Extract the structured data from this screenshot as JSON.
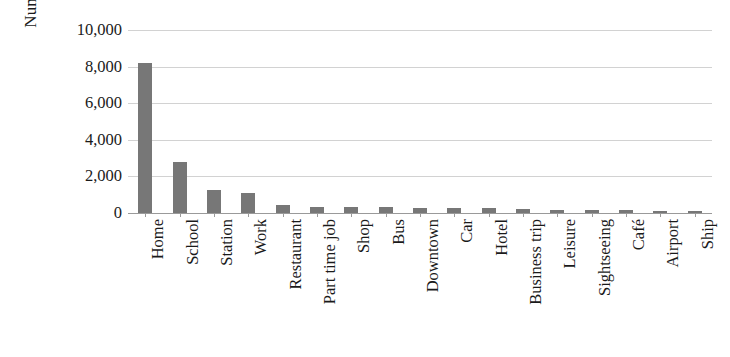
{
  "chart_data": {
    "type": "bar",
    "title": "",
    "xlabel": "",
    "ylabel": "Number of selections",
    "ylim": [
      0,
      10000
    ],
    "ytick_labels": [
      "10,000",
      "8,000",
      "6,000",
      "4,000",
      "2,000",
      "0"
    ],
    "yticks": [
      10000,
      8000,
      6000,
      4000,
      2000,
      0
    ],
    "grid": true,
    "legend": "none",
    "bar_color": "#777777",
    "gridline_color": "#d2d2d2",
    "axis_color": "#9a9a9a",
    "categories": [
      "Home",
      "School",
      "Station",
      "Work",
      "Restaurant",
      "Part time job",
      "Shop",
      "Bus",
      "Downtown",
      "Car",
      "Hotel",
      "Business trip",
      "Leisure",
      "Sightseeing",
      "Café",
      "Airport",
      "Ship"
    ],
    "values": [
      8200,
      2800,
      1250,
      1120,
      420,
      340,
      320,
      310,
      300,
      260,
      250,
      230,
      160,
      150,
      140,
      130,
      110
    ]
  }
}
